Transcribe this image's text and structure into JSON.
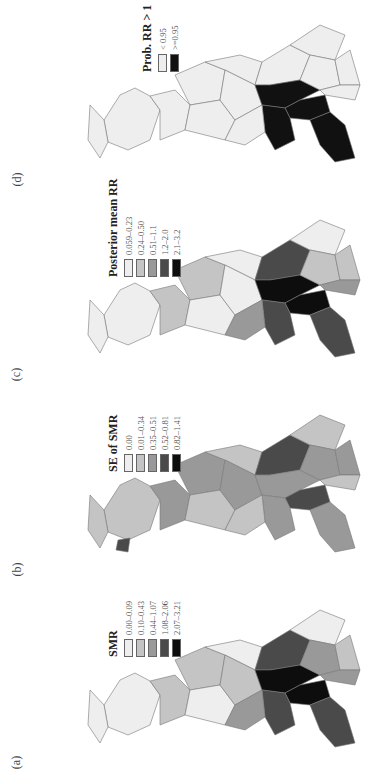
{
  "figure": {
    "orientation": "rotated-90-ccw",
    "panels": [
      {
        "id": "d",
        "label": "(d)",
        "legend": {
          "title": "Prob. RR > 1",
          "classes": [
            {
              "label": "< 0.95",
              "color": "#eeeeee"
            },
            {
              "label": ">=0.95",
              "color": "#111111"
            }
          ]
        }
      },
      {
        "id": "c",
        "label": "(c)",
        "legend": {
          "title": "Posterior mean RR",
          "classes": [
            {
              "label": "0.059–0.23",
              "color": "#eeeeee"
            },
            {
              "label": "0.24–0.50",
              "color": "#c4c4c4"
            },
            {
              "label": "0.51–1.1",
              "color": "#999999"
            },
            {
              "label": "1.2–2.0",
              "color": "#4a4a4a"
            },
            {
              "label": "2.1–3.2",
              "color": "#0d0d0d"
            }
          ]
        }
      },
      {
        "id": "b",
        "label": "(b)",
        "legend": {
          "title": "SE of SMR",
          "classes": [
            {
              "label": "0.00",
              "color": "#eeeeee"
            },
            {
              "label": "0.01–0.34",
              "color": "#c4c4c4"
            },
            {
              "label": "0.35–0.51",
              "color": "#999999"
            },
            {
              "label": "0.52–0.81",
              "color": "#4a4a4a"
            },
            {
              "label": "0.82–1.41",
              "color": "#0d0d0d"
            }
          ]
        }
      },
      {
        "id": "a",
        "label": "(a)",
        "legend": {
          "title": "SMR",
          "classes": [
            {
              "label": "0.00–0.09",
              "color": "#eeeeee"
            },
            {
              "label": "0.10–0.43",
              "color": "#c4c4c4"
            },
            {
              "label": "0.44–1.07",
              "color": "#999999"
            },
            {
              "label": "1.08–2.06",
              "color": "#4a4a4a"
            },
            {
              "label": "2.07–3.21",
              "color": "#0d0d0d"
            }
          ]
        }
      }
    ]
  }
}
